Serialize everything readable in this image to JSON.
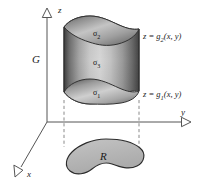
{
  "figure": {
    "background_color": "#ffffff",
    "axes": {
      "z_label": "z",
      "y_label": "y",
      "x_label": "x",
      "line_color": "#555555",
      "arrowhead": "hollow-triangle"
    },
    "solid": {
      "name_label": "G",
      "top_surface_label": "σ",
      "top_surface_sub": "2",
      "lateral_surface_label": "σ",
      "lateral_surface_sub": "3",
      "bottom_surface_label": "σ",
      "bottom_surface_sub": "1",
      "fill_light": "#e8e8e8",
      "fill_mid": "#a8a8a8",
      "fill_dark": "#4a4a4a",
      "outline_color": "#3a3a3a"
    },
    "equations": {
      "top": {
        "lhs": "z = g",
        "sub": "2",
        "rhs": "(x, y)"
      },
      "bottom": {
        "lhs": "z = g",
        "sub": "1",
        "rhs": "(x, y)"
      }
    },
    "region": {
      "label": "R",
      "fill_color": "#b9b9b9",
      "outline_color": "#2b2b2b"
    },
    "projection_lines": {
      "style": "dashed",
      "color": "#777777"
    }
  }
}
